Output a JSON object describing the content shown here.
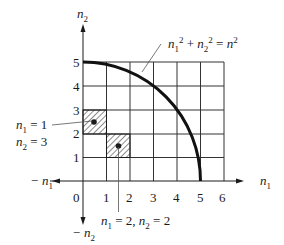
{
  "diagram": {
    "axes": {
      "x_label": "n",
      "x_sub": "1",
      "y_label": "n",
      "y_sub": "2",
      "neg_x_label": "− n",
      "neg_x_sub": "1",
      "neg_y_label": "− n",
      "neg_y_sub": "2",
      "x_ticks": [
        "0",
        "1",
        "2",
        "3",
        "4",
        "5",
        "6"
      ],
      "y_ticks": [
        "1",
        "2",
        "3",
        "4",
        "5"
      ]
    },
    "curve_label": {
      "a": "n",
      "a_sub": "1",
      "a_sup": "2",
      "plus": " + ",
      "b": "n",
      "b_sub": "2",
      "b_sup": "2",
      "eq": " = ",
      "c": "n",
      "c_sup": "2"
    },
    "state_a": {
      "line1_var": "n",
      "line1_sub": "1",
      "line1_val": " = 1",
      "line2_var": "n",
      "line2_sub": "2",
      "line2_val": " = 3"
    },
    "state_b": {
      "var1": "n",
      "sub1": "1",
      "val1": " = 2, ",
      "var2": "n",
      "sub2": "2",
      "val2": " = 2"
    },
    "grid": {
      "cols": 6,
      "rows": 5,
      "radius": 5
    },
    "colors": {
      "line": "#1a1a1a",
      "grid": "#333333",
      "leader": "#555555"
    }
  }
}
